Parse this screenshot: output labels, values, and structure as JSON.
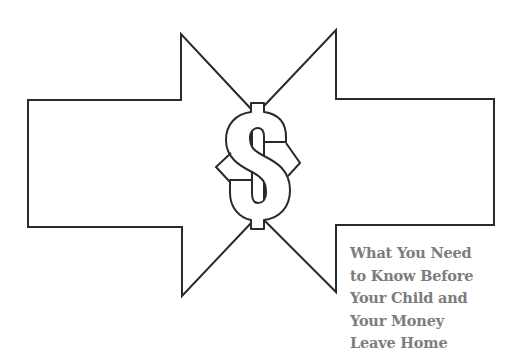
{
  "illustration": {
    "left_arrow": "arrow-right-outline",
    "right_arrow": "arrow-left-outline",
    "center_symbol": "$",
    "stroke_color": "#2a2a2a"
  },
  "caption": {
    "lines": [
      "What You Need",
      "to Know Before",
      "Your Child and",
      "Your Money",
      "Leave Home"
    ],
    "color": "#7d7d7d"
  }
}
